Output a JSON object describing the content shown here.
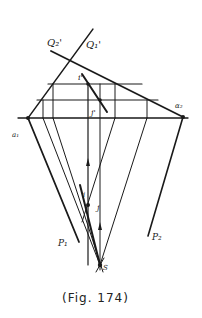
{
  "figure": {
    "caption": "(Fig. 174)",
    "labels": {
      "q2_prime": "Q₂'",
      "q1_prime": "Q₁'",
      "a1": "a₁",
      "alpha2": "α₂",
      "i_prime": "i'",
      "j_prime": "j'",
      "j": "j",
      "i": "i",
      "p1": "P₁",
      "p2": "P₂",
      "s": "S"
    },
    "colors": {
      "ink": "#1a1a1a",
      "background": "#ffffff"
    }
  }
}
